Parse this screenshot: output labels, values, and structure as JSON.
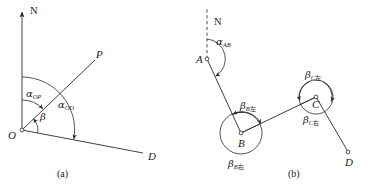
{
  "figure": {
    "type": "survey-azimuth-traverse-diagram",
    "background_color": "#ffffff",
    "line_color": "#2a2a2a",
    "panels": [
      {
        "id": "a",
        "caption": "(a)",
        "north_axis": {
          "label": "N",
          "style": "solid",
          "arrow": true
        },
        "points": [
          {
            "name": "O",
            "label": "O",
            "x": 22,
            "y": 130,
            "marker": "open-circle"
          },
          {
            "name": "P",
            "label": "P",
            "x": 97,
            "y": 58,
            "marker": "none"
          },
          {
            "name": "D",
            "label": "D",
            "x": 146,
            "y": 155,
            "marker": "none"
          }
        ],
        "angles": [
          {
            "name": "alpha_OP",
            "glyph": "α",
            "sub": "OP",
            "label": "αOP",
            "meaning": "azimuth of line OP"
          },
          {
            "name": "alpha_OD",
            "glyph": "α",
            "sub": "OD",
            "label": "αOD",
            "meaning": "azimuth of line OD"
          },
          {
            "name": "beta",
            "glyph": "β",
            "sub": "",
            "label": "β",
            "meaning": "horizontal angle POD"
          }
        ]
      },
      {
        "id": "b",
        "caption": "(b)",
        "north_axis": {
          "label": "N",
          "style": "dashed",
          "arrow": false
        },
        "points": [
          {
            "name": "A",
            "label": "A",
            "x": 207,
            "y": 59,
            "marker": "open-circle"
          },
          {
            "name": "B",
            "label": "B",
            "x": 241,
            "y": 133,
            "marker": "open-circle"
          },
          {
            "name": "C",
            "label": "C",
            "x": 316,
            "y": 97,
            "marker": "open-circle"
          },
          {
            "name": "D",
            "label": "D",
            "x": 348,
            "y": 152,
            "marker": "open-circle"
          }
        ],
        "angles": [
          {
            "name": "alpha_AB",
            "glyph": "α",
            "sub": "AB",
            "sub_cjk": "",
            "label": "αAB",
            "meaning": "azimuth of line AB"
          },
          {
            "name": "beta_B_left",
            "glyph": "β",
            "sub": "B",
            "sub_cjk": "左",
            "label": "βB左",
            "meaning": "left angle at station B"
          },
          {
            "name": "beta_B_right",
            "glyph": "β",
            "sub": "B",
            "sub_cjk": "右",
            "label": "βB右",
            "meaning": "right angle at station B"
          },
          {
            "name": "beta_C_left",
            "glyph": "β",
            "sub": "C",
            "sub_cjk": "左",
            "label": "βC左",
            "meaning": "left angle at station C"
          },
          {
            "name": "beta_C_right",
            "glyph": "β",
            "sub": "C",
            "sub_cjk": "右",
            "label": "βC右",
            "meaning": "right angle at station C"
          }
        ]
      }
    ]
  },
  "labels": {
    "panel_a": {
      "north": "N",
      "point_O": "O",
      "point_P": "P",
      "point_D": "D",
      "alpha_OP_glyph": "α",
      "alpha_OP_sub": "OP",
      "alpha_OD_glyph": "α",
      "alpha_OD_sub": "OD",
      "beta_glyph": "β",
      "caption": "(a)"
    },
    "panel_b": {
      "north": "N",
      "point_A": "A",
      "point_B": "B",
      "point_C": "C",
      "point_D": "D",
      "alpha_AB_glyph": "α",
      "alpha_AB_sub": "AB",
      "beta_B_left_glyph": "β",
      "beta_B_left_sub": "B",
      "beta_B_left_cjk": "左",
      "beta_B_right_glyph": "β",
      "beta_B_right_sub": "B",
      "beta_B_right_cjk": "右",
      "beta_C_left_glyph": "β",
      "beta_C_left_sub": "C",
      "beta_C_left_cjk": "左",
      "beta_C_right_glyph": "β",
      "beta_C_right_sub": "C",
      "beta_C_right_cjk": "右",
      "caption": "(b)"
    }
  }
}
